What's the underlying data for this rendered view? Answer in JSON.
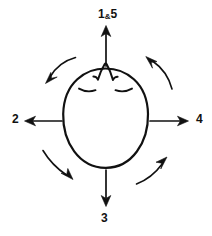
{
  "diagram": {
    "stroke_color": "#111111",
    "background_color": "#ffffff",
    "labels": {
      "top": {
        "text": "1&5",
        "number_primary": "1",
        "conjunction": "&",
        "number_secondary": "5",
        "position": "top"
      },
      "left": {
        "text": "2",
        "position": "left"
      },
      "right": {
        "text": "4",
        "position": "right"
      },
      "bottom": {
        "text": "3",
        "position": "bottom"
      }
    },
    "straight_arrows": [
      {
        "name": "up-arrow",
        "direction": "up",
        "label": "1&5"
      },
      {
        "name": "left-arrow",
        "direction": "left",
        "label": "2"
      },
      {
        "name": "right-arrow",
        "direction": "right",
        "label": "4"
      },
      {
        "name": "down-arrow",
        "direction": "down",
        "label": "3"
      }
    ],
    "curved_arrows": [
      {
        "name": "curved-arrow-upper-left",
        "points": "down-left"
      },
      {
        "name": "curved-arrow-upper-right",
        "points": "up-left"
      },
      {
        "name": "curved-arrow-lower-left",
        "points": "down-right"
      },
      {
        "name": "curved-arrow-lower-right",
        "points": "up-right"
      }
    ],
    "face": {
      "nose": "pointed-nose",
      "eyes": [
        "closed-eye-left",
        "closed-eye-right"
      ]
    }
  }
}
